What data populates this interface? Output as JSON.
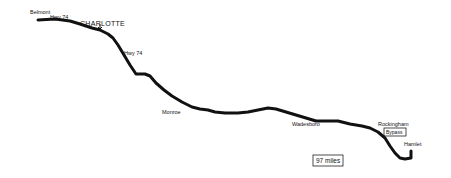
{
  "map": {
    "title": "Route map",
    "colors": {
      "road": "#111111",
      "background": "#ffffff",
      "ink": "#111111"
    },
    "places": {
      "belmont": "Belmont",
      "charlotte": "CHARLOTTE",
      "monroe": "Monroe",
      "wadesboro": "Wadesboro",
      "rockingham": "Rockingham",
      "hamlet": "Hamlet"
    },
    "highways": {
      "hwy74_a": "Hwy 74",
      "hwy74_b": "Hwy 74",
      "rockingham_box": "Bypass"
    },
    "distance": "97 miles",
    "road_name": "US Highway 74"
  }
}
